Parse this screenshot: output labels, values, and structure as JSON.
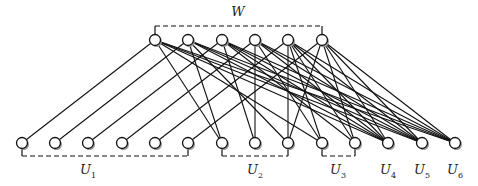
{
  "diagram": {
    "type": "bipartite-graph",
    "top_group": {
      "label": "W",
      "bracket": [
        155,
        322
      ],
      "bracket_y": 26
    },
    "top_nodes": [
      {
        "id": "w1",
        "x": 155,
        "y": 40
      },
      {
        "id": "w2",
        "x": 188,
        "y": 40
      },
      {
        "id": "w3",
        "x": 222,
        "y": 40
      },
      {
        "id": "w4",
        "x": 255,
        "y": 40
      },
      {
        "id": "w5",
        "x": 288,
        "y": 40
      },
      {
        "id": "w6",
        "x": 322,
        "y": 40
      }
    ],
    "bottom_nodes": [
      {
        "id": "b1",
        "x": 22,
        "y": 143,
        "group": "U1"
      },
      {
        "id": "b2",
        "x": 55,
        "y": 143,
        "group": "U1"
      },
      {
        "id": "b3",
        "x": 88,
        "y": 143,
        "group": "U1"
      },
      {
        "id": "b4",
        "x": 122,
        "y": 143,
        "group": "U1"
      },
      {
        "id": "b5",
        "x": 155,
        "y": 143,
        "group": "U1"
      },
      {
        "id": "b6",
        "x": 188,
        "y": 143,
        "group": "U1"
      },
      {
        "id": "b7",
        "x": 222,
        "y": 143,
        "group": "U2"
      },
      {
        "id": "b8",
        "x": 255,
        "y": 143,
        "group": "U2"
      },
      {
        "id": "b9",
        "x": 288,
        "y": 143,
        "group": "U2"
      },
      {
        "id": "b10",
        "x": 322,
        "y": 143,
        "group": "U3"
      },
      {
        "id": "b11",
        "x": 355,
        "y": 143,
        "group": "U3"
      },
      {
        "id": "b12",
        "x": 388,
        "y": 143,
        "group": "U4"
      },
      {
        "id": "b13",
        "x": 422,
        "y": 143,
        "group": "U5"
      },
      {
        "id": "b14",
        "x": 455,
        "y": 143,
        "group": "U6"
      }
    ],
    "bottom_groups": [
      {
        "label": "U",
        "sub": "1",
        "x": 88,
        "bracket": [
          22,
          188
        ]
      },
      {
        "label": "U",
        "sub": "2",
        "x": 255,
        "bracket": [
          222,
          288
        ]
      },
      {
        "label": "U",
        "sub": "3",
        "x": 338,
        "bracket": [
          322,
          355
        ]
      },
      {
        "label": "U",
        "sub": "4",
        "x": 388,
        "bracket": null
      },
      {
        "label": "U",
        "sub": "5",
        "x": 422,
        "bracket": null
      },
      {
        "label": "U",
        "sub": "6",
        "x": 455,
        "bracket": null
      }
    ],
    "edges": [
      [
        "w1",
        "b1"
      ],
      [
        "w2",
        "b2"
      ],
      [
        "w3",
        "b3"
      ],
      [
        "w4",
        "b4"
      ],
      [
        "w5",
        "b5"
      ],
      [
        "w6",
        "b6"
      ],
      [
        "w1",
        "b7"
      ],
      [
        "w2",
        "b7"
      ],
      [
        "w3",
        "b8"
      ],
      [
        "w4",
        "b8"
      ],
      [
        "w2",
        "b9"
      ],
      [
        "w5",
        "b9"
      ],
      [
        "w6",
        "b9"
      ],
      [
        "w1",
        "b10"
      ],
      [
        "w4",
        "b10"
      ],
      [
        "w5",
        "b10"
      ],
      [
        "w3",
        "b11"
      ],
      [
        "w5",
        "b11"
      ],
      [
        "w6",
        "b11"
      ],
      [
        "w1",
        "b12"
      ],
      [
        "w2",
        "b12"
      ],
      [
        "w3",
        "b12"
      ],
      [
        "w4",
        "b12"
      ],
      [
        "w5",
        "b12"
      ],
      [
        "w6",
        "b12"
      ],
      [
        "w1",
        "b13"
      ],
      [
        "w2",
        "b13"
      ],
      [
        "w3",
        "b13"
      ],
      [
        "w4",
        "b13"
      ],
      [
        "w5",
        "b13"
      ],
      [
        "w6",
        "b13"
      ],
      [
        "w1",
        "b14"
      ],
      [
        "w2",
        "b14"
      ],
      [
        "w3",
        "b14"
      ],
      [
        "w4",
        "b14"
      ],
      [
        "w5",
        "b14"
      ],
      [
        "w6",
        "b14"
      ]
    ],
    "colors": {
      "stroke": "#111111",
      "node_fill": "#ffffff",
      "shadow": "#9a9a9a"
    }
  }
}
